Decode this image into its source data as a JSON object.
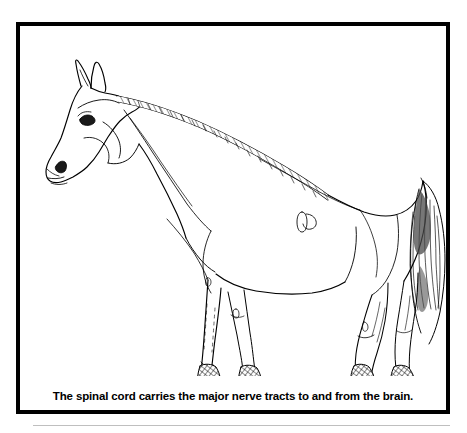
{
  "figure": {
    "caption": "The spinal cord carries the major nerve tracts to and from the brain.",
    "style": "black-and-white line art",
    "colors": {
      "ink": "#000000",
      "background": "#ffffff",
      "frame": "#000000",
      "rule": "#bfbfbf"
    },
    "frame": {
      "border_width_px": 4,
      "x": 16,
      "y": 22,
      "width": 434,
      "height": 392
    },
    "anatomy_labels": [
      "head",
      "ear",
      "eye",
      "nostril",
      "muzzle",
      "mane",
      "neck",
      "withers",
      "back",
      "croup",
      "tail",
      "shoulder",
      "foreleg",
      "hindleg",
      "hock",
      "fetlock",
      "hoof",
      "barrel",
      "flank"
    ]
  }
}
